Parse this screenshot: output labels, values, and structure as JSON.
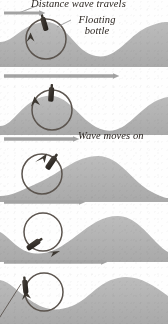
{
  "figure": {
    "title_text": "Distance wave travels",
    "bottle_label_line1": "Floating",
    "bottle_label_line2": "bottle",
    "wave_moves_label": "Wave moves on",
    "bottom_caption": "",
    "colors": {
      "water": "#b0b0b0",
      "water_light": "#c6c6c6",
      "arrow_grey": "#a8a8a8",
      "bottle_dark": "#3a3530",
      "circle_stroke": "#59524c",
      "background": "#fefefe",
      "text": "#2a241f"
    }
  },
  "panels": [
    {
      "index": 1,
      "name": "panel-crest-at-bottle",
      "top": 12,
      "height": 55,
      "caption": "Bottle at wave crest; circular motion arrow points upward-left",
      "wave_path": "M0,30 C14,30 22,12 44,10 C66,8 74,40 96,44 C118,48 128,22 150,14 C160,10 164,10 168,10 L168,55 L0,55 Z",
      "circle": {
        "cx": 46,
        "cy": 27,
        "r": 20
      },
      "bottle": {
        "x": 42,
        "y": 8,
        "angle": -18
      },
      "motion_arrow": "counter-clockwise-up",
      "has_header_arrow": true,
      "header_arrow": {
        "x1": 4,
        "x2": 44,
        "y": 7
      }
    },
    {
      "index": 2,
      "name": "panel-rising-slope",
      "top": 80,
      "height": 55,
      "caption": "Wave has moved on; bottle rides the rising slope",
      "wave_path": "M0,46 C14,46 22,20 46,16 C70,12 80,44 104,50 C126,55 136,30 158,20 C163,18 166,17 168,17 L168,55 L0,55 Z",
      "circle": {
        "cx": 52,
        "cy": 30,
        "r": 20
      },
      "bottle": {
        "x": 52,
        "y": 11,
        "angle": 0
      },
      "motion_arrow": "counter-clockwise-left",
      "has_header_arrow": true,
      "header_arrow": {
        "x1": 4,
        "x2": 82,
        "y": 7
      }
    },
    {
      "index": 3,
      "name": "panel-wave-moves-on",
      "top": 148,
      "height": 54,
      "caption": "Wave moves on; bottle slides down the forward face",
      "wave_path": "M0,48 C12,48 22,42 40,34 C60,25 76,8 98,8 C120,8 132,34 152,44 C160,48 165,50 168,50 L168,54 L0,54 Z",
      "circle": {
        "cx": 42,
        "cy": 26,
        "r": 20
      },
      "bottle": {
        "x": 54,
        "y": 16,
        "angle": 32
      },
      "motion_arrow": "counter-clockwise-right",
      "has_header_arrow": true,
      "header_arrow": {
        "x1": 4,
        "x2": 70,
        "y": 7
      }
    },
    {
      "index": 4,
      "name": "panel-trough",
      "top": 210,
      "height": 52,
      "caption": "Bottle in trough; motion arrow points down-right",
      "wave_path": "M0,22 C8,26 16,38 28,42 C44,47 58,40 76,26 C92,14 102,6 118,6 C134,6 146,22 158,34 C163,39 166,41 168,42 L168,52 L0,52 Z",
      "circle": {
        "cx": 43,
        "cy": 22,
        "r": 19
      },
      "bottle": {
        "x": 44,
        "y": 39,
        "angle": 62
      },
      "motion_arrow": "clockwise-down-right",
      "has_header_arrow": true,
      "header_arrow": {
        "x1": 4,
        "x2": 86,
        "y": 7
      }
    },
    {
      "index": 5,
      "name": "panel-rising-again",
      "top": 270,
      "height": 54,
      "caption": "Bottle rising again on the next crest, with pointer line",
      "wave_path": "M0,10 C10,12 18,22 30,30 C44,40 56,42 72,36 C88,30 98,12 118,8 C136,4 152,14 168,26 L168,54 L0,54 Z",
      "circle": {
        "cx": 44,
        "cy": 22,
        "r": 19
      },
      "bottle": {
        "x": 26,
        "y": 22,
        "angle": -8
      },
      "motion_arrow": "counter-clockwise-up-left",
      "has_header_arrow": true,
      "header_arrow": {
        "x1": 4,
        "x2": 104,
        "y": 7
      },
      "pointer_line": {
        "x1": 2,
        "y1": 52,
        "x2": 27,
        "y2": 24
      }
    }
  ],
  "annotations": [
    {
      "name": "distance-arrow",
      "panel": 1,
      "description": "short grey arrow at top left indicating distance wave travels"
    },
    {
      "name": "leader-line-title",
      "panel": 1,
      "description": "thin leader line from title to arrow"
    },
    {
      "name": "leader-line-bottle",
      "panel": 1,
      "description": "thin leader line from 'Floating bottle' to the bottle"
    }
  ]
}
